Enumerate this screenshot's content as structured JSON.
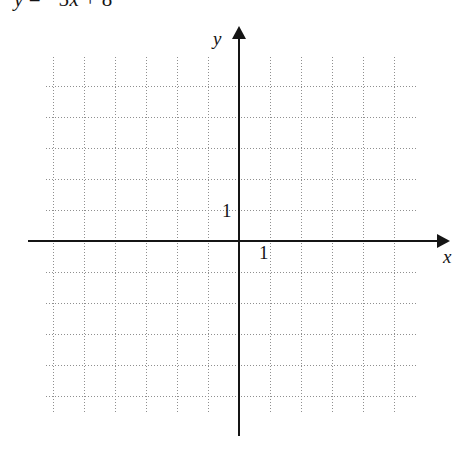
{
  "equation": {
    "lhs": "y",
    "equals": "=",
    "rhs_sign": "−",
    "rhs_coefficient": "5",
    "rhs_variable": "x",
    "rhs_operator": "+",
    "rhs_constant": "8",
    "full_text": "y = −5x + 8"
  },
  "graph": {
    "x_axis_label": "x",
    "y_axis_label": "y",
    "x_tick_label": "1",
    "y_tick_label": "1",
    "grid_color": "#8f8f8f",
    "axis_color": "#151515",
    "background_color": "#ffffff"
  },
  "chart_data": {
    "type": "line",
    "title": "",
    "xlabel": "x",
    "ylabel": "y",
    "xlim": [
      -6.25,
      5.7
    ],
    "ylim": [
      -5.6,
      6.6
    ],
    "unit_spacing_px": 31,
    "grid": true,
    "grid_step": 1,
    "legend": null,
    "annotations": [
      "1",
      "1"
    ],
    "series": [],
    "note": "Empty coordinate grid provided for graphing the line y = −5x + 8"
  }
}
